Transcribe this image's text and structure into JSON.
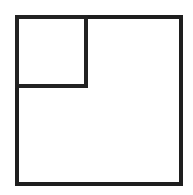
{
  "canvas": {
    "width": 193,
    "height": 195,
    "background_color": "#ffffff",
    "title": "Nested squares line figure"
  },
  "figure": {
    "stroke_color": "#1e1e1e",
    "stroke_width": 4,
    "fill": "none"
  },
  "shapes": [
    {
      "name": "outer-square",
      "type": "rect",
      "x": 17,
      "y": 17,
      "width": 164,
      "height": 167,
      "stroke_color": "#1e1e1e",
      "stroke_width": 4
    },
    {
      "name": "inner-square",
      "type": "rect",
      "x": 17,
      "y": 17,
      "width": 69,
      "height": 69,
      "stroke_color": "#222222",
      "stroke_width": 4
    }
  ],
  "chart_data": {
    "type": "diagram",
    "subtitle": "",
    "xlabel": "",
    "ylabel": "",
    "grid": false,
    "legend": "none",
    "annotations": [],
    "elements": [
      {
        "label": "outer square",
        "left": 17,
        "top": 17,
        "right": 181,
        "bottom": 184,
        "side_length_px": 166
      },
      {
        "label": "inner square",
        "left": 17,
        "top": 17,
        "right": 86,
        "bottom": 86,
        "side_length_px": 69
      }
    ]
  }
}
